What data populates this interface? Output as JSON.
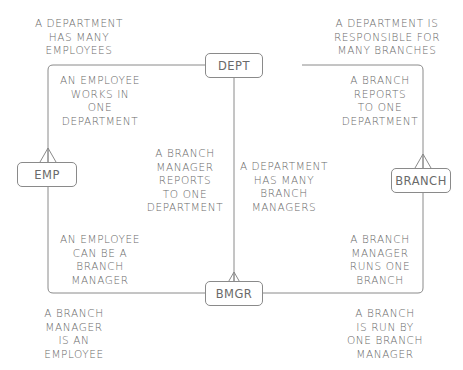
{
  "entities": {
    "dept": "DEPT",
    "emp": "EMP",
    "branch": "BRANCH",
    "bmgr": "BMGR"
  },
  "notes": {
    "top_left": "A DEPARTMENT\nHAS MANY\nEMPLOYEES",
    "top_right": "A DEPARTMENT IS\nRESPONSIBLE FOR\nMANY BRANCHES",
    "inner_top_left": "AN EMPLOYEE\nWORKS IN\nONE\nDEPARTMENT",
    "inner_top_right": "A BRANCH\nREPORTS\nTO ONE\nDEPARTMENT",
    "center_left": "A BRANCH\nMANAGER\nREPORTS\nTO ONE\nDEPARTMENT",
    "center_right": "A DEPARTMENT\nHAS MANY\nBRANCH\nMANAGERS",
    "inner_bottom_left": "AN EMPLOYEE\nCAN BE A\nBRANCH\nMANAGER",
    "inner_bottom_right": "A BRANCH\nMANAGER\nRUNS ONE\nBRANCH",
    "bottom_left": "A BRANCH\nMANAGER\nIS AN\nEMPLOYEE",
    "bottom_right": "A BRANCH\nIS RUN BY\nONE BRANCH\nMANAGER"
  },
  "colors": {
    "line": "#8a8a8a",
    "text": "#6a6a6a",
    "background": "#ffffff"
  }
}
